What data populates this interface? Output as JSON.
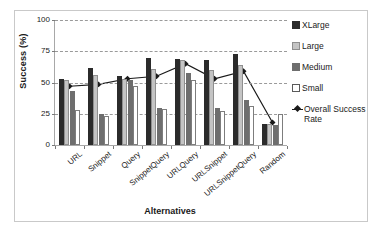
{
  "chart_data": {
    "type": "bar",
    "title": "",
    "xlabel": "Alternatives",
    "ylabel": "Success (%)",
    "ylim": [
      0,
      100
    ],
    "yticks": [
      0,
      25,
      50,
      75,
      100
    ],
    "grid": "horizontal-dashed",
    "legend_position": "right",
    "categories": [
      "URL",
      "Snippet",
      "Query",
      "SnippetQuery",
      "URLQuery",
      "URLSnippet",
      "URLSnippetQuery",
      "Random"
    ],
    "series": [
      {
        "name": "XLarge",
        "type": "bar",
        "color": "#2b2b2b",
        "values": [
          53,
          62,
          55,
          70,
          69,
          68,
          73,
          17
        ]
      },
      {
        "name": "Large",
        "type": "bar",
        "color": "#c4c4c4",
        "values": [
          52,
          56,
          53,
          61,
          68,
          60,
          64,
          17
        ]
      },
      {
        "name": "Medium",
        "type": "bar",
        "color": "#6e6e6e",
        "values": [
          43,
          25,
          52,
          30,
          58,
          30,
          36,
          16
        ]
      },
      {
        "name": "Small",
        "type": "bar",
        "color": "#ffffff",
        "values": [
          28,
          23,
          47,
          29,
          52,
          27,
          31,
          25
        ]
      },
      {
        "name": "Overall Success Rate",
        "type": "line",
        "color": "#1a1a1a",
        "marker": "diamond",
        "values": [
          47,
          48.5,
          53,
          55,
          65,
          53,
          59,
          18
        ]
      }
    ]
  },
  "legend": {
    "items": [
      {
        "label": "XLarge",
        "swatch": "legend-swatch-xlarge"
      },
      {
        "label": "Large",
        "swatch": "legend-swatch-large"
      },
      {
        "label": "Medium",
        "swatch": "legend-swatch-medium"
      },
      {
        "label": "Small",
        "swatch": "legend-swatch-small"
      },
      {
        "label": "Overall Success Rate",
        "swatch": "legend-swatch-line"
      }
    ]
  }
}
